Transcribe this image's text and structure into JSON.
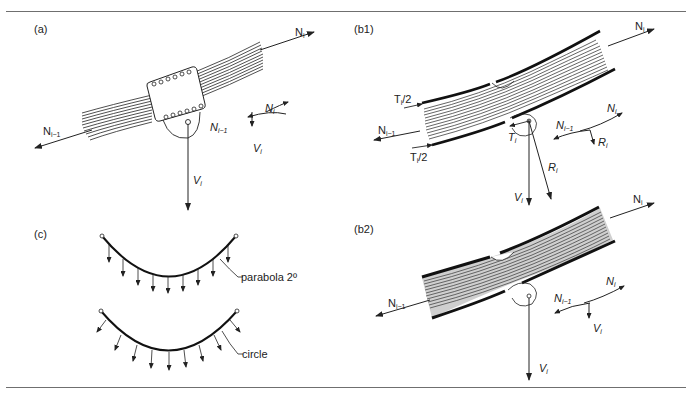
{
  "figure": {
    "top_caption_fragment": "Fig. ... Diag...",
    "panels": [
      {
        "id": "a",
        "label": "(a)",
        "forces": {
          "n_right": "N",
          "n_right_sub": "i",
          "n_left": "N",
          "n_left_sub": "i−1",
          "v": "V",
          "v_sub": "i"
        },
        "inset": {
          "n_right": "N",
          "n_right_sub": "i",
          "n_left": "N",
          "n_left_sub": "i−1",
          "v": "V",
          "v_sub": "i"
        }
      },
      {
        "id": "b1",
        "label": "(b1)",
        "forces": {
          "n_right": "N",
          "n_right_sub": "i",
          "n_left": "N",
          "n_left_sub": "i−1",
          "t_half_top": "T",
          "t_half_top_sub": "i",
          "t_half_top_rest": "/2",
          "t_half_bottom": "T",
          "t_half_bottom_sub": "i",
          "t_half_bottom_rest": "/2",
          "t": "T",
          "t_sub": "i",
          "r": "R",
          "r_sub": "i",
          "v": "V",
          "v_sub": "i"
        },
        "inset": {
          "n_right": "N",
          "n_right_sub": "i",
          "n_left": "N",
          "n_left_sub": "i−1",
          "r": "R",
          "r_sub": "i"
        }
      },
      {
        "id": "c",
        "label": "(c)",
        "curves": [
          {
            "name": "parabola",
            "label": "parabola 2º"
          },
          {
            "name": "circle",
            "label": "circle"
          }
        ]
      },
      {
        "id": "b2",
        "label": "(b2)",
        "forces": {
          "n_right": "N",
          "n_right_sub": "i",
          "n_left": "N",
          "n_left_sub": "i−1",
          "v": "V",
          "v_sub": "i"
        },
        "inset": {
          "n_right": "N",
          "n_right_sub": "i",
          "n_left": "N",
          "n_left_sub": "i−1",
          "v": "V",
          "v_sub": "i"
        }
      }
    ]
  }
}
